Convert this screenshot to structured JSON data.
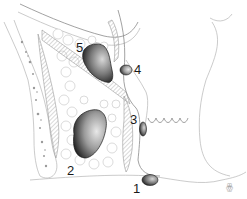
{
  "figure": {
    "type": "anatomical line drawing",
    "view": "sagittal section",
    "labels": [
      {
        "id": "1",
        "text": "1"
      },
      {
        "id": "2",
        "text": "2"
      },
      {
        "id": "3",
        "text": "3"
      },
      {
        "id": "4",
        "text": "4"
      },
      {
        "id": "5",
        "text": "5"
      }
    ],
    "signature_mark": "ꙮ",
    "colors": {
      "ink": "#1a1a1a",
      "line": "#8a8a8a",
      "hatch": "#9a9a9a",
      "background": "#ffffff"
    }
  }
}
